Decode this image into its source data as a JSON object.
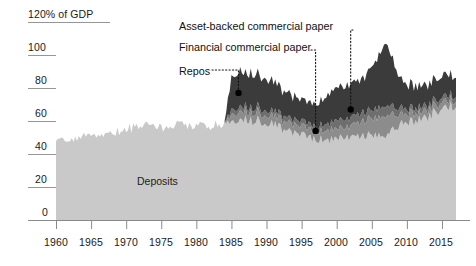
{
  "chart_data": {
    "type": "area",
    "title": "",
    "subtitle": "",
    "xlabel": "",
    "ylabel": "120% of GDP",
    "yunit_label": "120% of GDP",
    "xlim": [
      1960,
      2017
    ],
    "ylim": [
      0,
      120
    ],
    "yticks": [
      0,
      20,
      40,
      60,
      80,
      100,
      120
    ],
    "ytick_labels": [
      "0",
      "20",
      "40",
      "60",
      "80",
      "100",
      "120% of GDP"
    ],
    "xticks": [
      1960,
      1965,
      1970,
      1975,
      1980,
      1985,
      1990,
      1995,
      2000,
      2005,
      2010,
      2015
    ],
    "xtick_labels": [
      "1960",
      "1965",
      "1970",
      "1975",
      "1980",
      "1985",
      "1990",
      "1995",
      "2000",
      "2005",
      "2010",
      "2015"
    ],
    "grid": "horizontal-short-ticks",
    "legend_position": "in-plot-annotations",
    "stacked": true,
    "colors": {
      "deposits": "#c9c9c9",
      "repos": "#8c8c8c",
      "financial_commercial_paper": "#6e6e6e",
      "asset_backed_commercial_paper": "#3b3b3b",
      "text": "#111111",
      "axis": "#8a8a8a",
      "background": "#ffffff"
    },
    "x": [
      1960,
      1961,
      1962,
      1963,
      1964,
      1965,
      1966,
      1967,
      1968,
      1969,
      1970,
      1971,
      1972,
      1973,
      1974,
      1975,
      1976,
      1977,
      1978,
      1979,
      1980,
      1981,
      1982,
      1983,
      1984,
      1985,
      1986,
      1987,
      1988,
      1989,
      1990,
      1991,
      1992,
      1993,
      1994,
      1995,
      1996,
      1997,
      1998,
      1999,
      2000,
      2001,
      2002,
      2003,
      2004,
      2005,
      2006,
      2007,
      2008,
      2009,
      2010,
      2011,
      2012,
      2013,
      2014,
      2015,
      2016,
      2017
    ],
    "series": [
      {
        "name": "Deposits",
        "color": "#c9c9c9",
        "values": [
          47,
          48,
          49,
          50,
          51,
          52,
          52,
          53,
          53,
          54,
          55,
          56,
          56,
          57,
          56,
          56,
          57,
          57,
          58,
          58,
          58,
          57,
          57,
          58,
          59,
          60,
          61,
          61,
          60,
          60,
          59,
          58,
          56,
          54,
          52,
          51,
          50,
          49,
          49,
          49,
          49,
          50,
          51,
          51,
          51,
          51,
          51,
          51,
          55,
          58,
          59,
          60,
          62,
          63,
          65,
          67,
          69,
          70
        ]
      },
      {
        "name": "Repos",
        "color": "#8c8c8c",
        "values": [
          0,
          0,
          0,
          0,
          0,
          0,
          0,
          0,
          0,
          0,
          0,
          0,
          0,
          0,
          0,
          0,
          0,
          0,
          0,
          0,
          0,
          0,
          0,
          0,
          0,
          4,
          5,
          5,
          5,
          5,
          5,
          5,
          5,
          5,
          5,
          5,
          5,
          5,
          5,
          6,
          6,
          6,
          7,
          8,
          9,
          10,
          11,
          12,
          9,
          6,
          5,
          5,
          4,
          4,
          4,
          4,
          4,
          3
        ]
      },
      {
        "name": "Financial commercial paper",
        "color": "#6e6e6e",
        "values": [
          0,
          0,
          0,
          0,
          0,
          0,
          0,
          0,
          0,
          0,
          0,
          0,
          0,
          0,
          0,
          0,
          0,
          0,
          0,
          0,
          0,
          0,
          0,
          0,
          0,
          3,
          3,
          3,
          3,
          3,
          3,
          3,
          3,
          3,
          3,
          3,
          3,
          3,
          4,
          4,
          5,
          5,
          5,
          5,
          5,
          5,
          6,
          6,
          5,
          4,
          3,
          3,
          3,
          3,
          3,
          3,
          3,
          3
        ]
      },
      {
        "name": "Asset-backed commercial paper",
        "color": "#3b3b3b",
        "values": [
          0,
          0,
          0,
          0,
          0,
          0,
          0,
          0,
          0,
          0,
          0,
          0,
          0,
          0,
          0,
          0,
          0,
          0,
          0,
          0,
          0,
          0,
          0,
          0,
          0,
          20,
          22,
          21,
          21,
          20,
          19,
          18,
          16,
          15,
          14,
          13,
          13,
          14,
          16,
          18,
          20,
          20,
          20,
          20,
          22,
          26,
          32,
          38,
          28,
          18,
          15,
          14,
          13,
          13,
          13,
          13,
          13,
          12
        ]
      }
    ],
    "annotations": [
      {
        "label": "Asset-backed commercial paper",
        "marker_x": 2002,
        "marker_y": 67
      },
      {
        "label": "Financial commercial paper",
        "marker_x": 1997,
        "marker_y": 54
      },
      {
        "label": "Repos",
        "marker_x": 1986,
        "marker_y": 77
      },
      {
        "label": "Deposits",
        "inline": true
      }
    ]
  },
  "labels": {
    "asset_backed": "Asset-backed commercial paper",
    "financial": "Financial commercial paper",
    "repos": "Repos",
    "deposits": "Deposits"
  },
  "yticks": {
    "t0": "0",
    "t20": "20",
    "t40": "40",
    "t60": "60",
    "t80": "80",
    "t100": "100",
    "t120": "120% of GDP"
  },
  "xticks": {
    "t1960": "1960",
    "t1965": "1965",
    "t1970": "1970",
    "t1975": "1975",
    "t1980": "1980",
    "t1985": "1985",
    "t1990": "1990",
    "t1995": "1995",
    "t2000": "2000",
    "t2005": "2005",
    "t2010": "2010",
    "t2015": "2015"
  }
}
